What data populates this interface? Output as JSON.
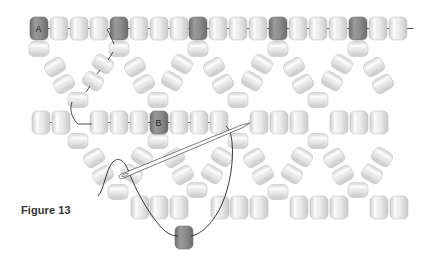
{
  "figure": {
    "caption": "Figure 13",
    "labels": {
      "a": "A",
      "b": "B"
    }
  },
  "colors": {
    "background": "#ffffff",
    "bead_light": "#e4e4e4",
    "bead_light_edge": "#c4c4c4",
    "bead_light_highlight": "#f8f8f8",
    "bead_dark": "#8a8a8a",
    "bead_dark_edge": "#6e6e6e",
    "thread": "#3a3a3a",
    "needle": "#9a9a9a"
  },
  "bead_size": {
    "w": 18,
    "h": 23
  },
  "rows": {
    "top": {
      "y": 17,
      "beads": [
        {
          "x": 30,
          "dark": true,
          "label": "A"
        },
        {
          "x": 50
        },
        {
          "x": 70
        },
        {
          "x": 90
        },
        {
          "x": 110,
          "dark": true
        },
        {
          "x": 130
        },
        {
          "x": 150
        },
        {
          "x": 170
        },
        {
          "x": 189,
          "dark": true
        },
        {
          "x": 209
        },
        {
          "x": 229
        },
        {
          "x": 249
        },
        {
          "x": 269,
          "dark": true
        },
        {
          "x": 289
        },
        {
          "x": 309
        },
        {
          "x": 329
        },
        {
          "x": 349,
          "dark": true
        },
        {
          "x": 369
        },
        {
          "x": 389
        }
      ]
    },
    "middle": {
      "y": 111,
      "beads": [
        {
          "x": 32
        },
        {
          "x": 52
        },
        {
          "x": 90
        },
        {
          "x": 110
        },
        {
          "x": 130
        },
        {
          "x": 150,
          "dark": true,
          "label": "B"
        },
        {
          "x": 170
        },
        {
          "x": 190
        },
        {
          "x": 210
        },
        {
          "x": 250
        },
        {
          "x": 270
        },
        {
          "x": 290
        },
        {
          "x": 330
        },
        {
          "x": 350
        },
        {
          "x": 370
        }
      ]
    },
    "bottom": {
      "y": 196,
      "beads": [
        {
          "x": 131
        },
        {
          "x": 150
        },
        {
          "x": 170
        },
        {
          "x": 211
        },
        {
          "x": 230
        },
        {
          "x": 250
        },
        {
          "x": 290
        },
        {
          "x": 310
        },
        {
          "x": 330
        },
        {
          "x": 370
        },
        {
          "x": 390
        }
      ]
    }
  },
  "upper_zigzag": {
    "top_caps": [
      {
        "cx": 39,
        "cy": 49
      },
      {
        "cx": 119,
        "cy": 49
      },
      {
        "cx": 198,
        "cy": 49
      },
      {
        "cx": 278,
        "cy": 49
      },
      {
        "cx": 358,
        "cy": 49
      }
    ],
    "v_bottoms": [
      {
        "cx": 78,
        "cy": 100
      },
      {
        "cx": 158,
        "cy": 100
      },
      {
        "cx": 238,
        "cy": 100
      },
      {
        "cx": 318,
        "cy": 100
      }
    ],
    "tilted": [
      {
        "cx": 55,
        "cy": 67,
        "rot": -30
      },
      {
        "cx": 64,
        "cy": 84,
        "rot": -30
      },
      {
        "cx": 103,
        "cy": 64,
        "rot": 30
      },
      {
        "cx": 93,
        "cy": 81,
        "rot": 30
      },
      {
        "cx": 135,
        "cy": 67,
        "rot": -30
      },
      {
        "cx": 144,
        "cy": 84,
        "rot": -30
      },
      {
        "cx": 182,
        "cy": 64,
        "rot": 30
      },
      {
        "cx": 172,
        "cy": 81,
        "rot": 30
      },
      {
        "cx": 214,
        "cy": 67,
        "rot": -30
      },
      {
        "cx": 223,
        "cy": 84,
        "rot": -30
      },
      {
        "cx": 262,
        "cy": 64,
        "rot": 30
      },
      {
        "cx": 252,
        "cy": 81,
        "rot": 30
      },
      {
        "cx": 294,
        "cy": 67,
        "rot": -30
      },
      {
        "cx": 303,
        "cy": 84,
        "rot": -30
      },
      {
        "cx": 342,
        "cy": 64,
        "rot": 30
      },
      {
        "cx": 332,
        "cy": 81,
        "rot": 30
      },
      {
        "cx": 374,
        "cy": 67,
        "rot": -30
      },
      {
        "cx": 383,
        "cy": 84,
        "rot": -30
      }
    ]
  },
  "lower_zigzag": {
    "top_caps": [
      {
        "cx": 78,
        "cy": 141
      },
      {
        "cx": 158,
        "cy": 141
      },
      {
        "cx": 238,
        "cy": 141
      },
      {
        "cx": 318,
        "cy": 141
      }
    ],
    "v_bottoms": [
      {
        "cx": 118,
        "cy": 192
      },
      {
        "cx": 197,
        "cy": 190
      },
      {
        "cx": 278,
        "cy": 192
      },
      {
        "cx": 358,
        "cy": 190
      }
    ],
    "tilted": [
      {
        "cx": 94,
        "cy": 158,
        "rot": -30
      },
      {
        "cx": 103,
        "cy": 175,
        "rot": -30
      },
      {
        "cx": 142,
        "cy": 157,
        "rot": 30
      },
      {
        "cx": 132,
        "cy": 174,
        "rot": 30
      },
      {
        "cx": 174,
        "cy": 158,
        "rot": -30
      },
      {
        "cx": 183,
        "cy": 175,
        "rot": -30
      },
      {
        "cx": 222,
        "cy": 157,
        "rot": 30
      },
      {
        "cx": 212,
        "cy": 174,
        "rot": 30
      },
      {
        "cx": 254,
        "cy": 158,
        "rot": -30
      },
      {
        "cx": 263,
        "cy": 175,
        "rot": -30
      },
      {
        "cx": 302,
        "cy": 157,
        "rot": 30
      },
      {
        "cx": 292,
        "cy": 174,
        "rot": 30
      },
      {
        "cx": 334,
        "cy": 158,
        "rot": -30
      },
      {
        "cx": 343,
        "cy": 175,
        "rot": -30
      },
      {
        "cx": 382,
        "cy": 157,
        "rot": 30
      },
      {
        "cx": 372,
        "cy": 174,
        "rot": 30
      }
    ]
  },
  "loose_bead": {
    "cx": 184,
    "cy": 237,
    "dark": true
  },
  "needle": {
    "eye_x": 125,
    "eye_y": 175,
    "tip_x": 250,
    "tip_y": 123
  }
}
